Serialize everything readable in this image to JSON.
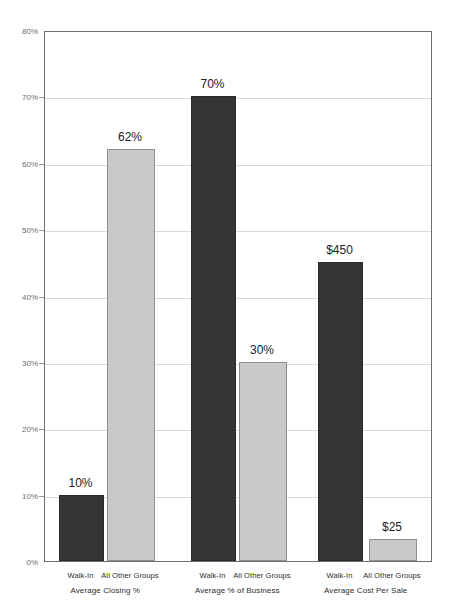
{
  "chart_data": {
    "type": "bar",
    "title": "",
    "subtitle": "",
    "xlabel": "",
    "ylabel": "",
    "ylim": [
      0,
      80
    ],
    "grid": true,
    "legend": "none",
    "y_ticks": [
      "0%",
      "10%",
      "20%",
      "30%",
      "40%",
      "50%",
      "60%",
      "70%",
      "80%"
    ],
    "y_tick_values": [
      0,
      10,
      20,
      30,
      40,
      50,
      60,
      70,
      80
    ],
    "categories": [
      "Walk-In",
      "All Other Groups",
      "Walk-In",
      "All Other Groups",
      "Walk-In",
      "All Other Groups"
    ],
    "groups": [
      {
        "label": "Average Closing %",
        "bars": [
          {
            "category": "Walk-In",
            "label": "10%",
            "value": 10,
            "color": "#353535",
            "style": "dark"
          },
          {
            "category": "All Other Groups",
            "label": "62%",
            "value": 62,
            "color": "#c9c9c9",
            "style": "light"
          }
        ]
      },
      {
        "label": "Average % of Business",
        "bars": [
          {
            "category": "Walk-In",
            "label": "70%",
            "value": 70,
            "color": "#353535",
            "style": "dark"
          },
          {
            "category": "All Other Groups",
            "label": "30%",
            "value": 30,
            "color": "#c9c9c9",
            "style": "light"
          }
        ]
      },
      {
        "label": "Average Cost Per Sale",
        "bars": [
          {
            "category": "Walk-In",
            "label": "$450",
            "value": 45,
            "color": "#353535",
            "style": "dark"
          },
          {
            "category": "All Other Groups",
            "label": "$25",
            "value": 3.3,
            "color": "#c9c9c9",
            "style": "light"
          }
        ]
      }
    ],
    "values": [
      10,
      62,
      70,
      30,
      45,
      3.3
    ],
    "value_labels": [
      "10%",
      "62%",
      "70%",
      "30%",
      "$450",
      "$25"
    ],
    "colors": {
      "dark_bar": "#353535",
      "light_bar": "#c9c9c9",
      "gridline": "#d9d9d9",
      "axis": "#6e6e6e",
      "tick_text": "#6d6d6d",
      "label_text": "#2d2d2d",
      "background": "#ffffff"
    }
  }
}
